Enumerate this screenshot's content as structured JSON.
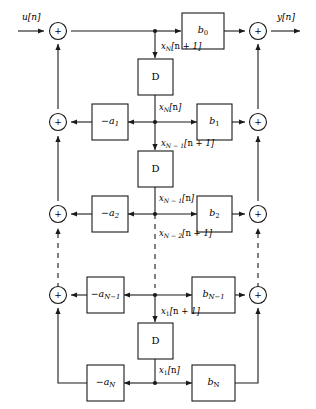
{
  "diagram": {
    "input_label": "u[n]",
    "output_label": "y[n]",
    "delay_label": "D",
    "sum_symbol": "+",
    "line_color": "#1a1a1a",
    "background_color": "#ffffff"
  },
  "delays": [
    {
      "name": "delay-1",
      "label": "D"
    },
    {
      "name": "delay-2",
      "label": "D"
    },
    {
      "name": "delay-3",
      "label": "D"
    },
    {
      "name": "delay-4",
      "label": "D"
    }
  ],
  "feedback_gains": [
    {
      "name": "gain-a1",
      "label_html": "−a<span class=\"sub\">1</span>",
      "text": "-a1"
    },
    {
      "name": "gain-a2",
      "label_html": "−a<span class=\"sub\">2</span>",
      "text": "-a2"
    },
    {
      "name": "gain-aN1",
      "label_html": "−a<span class=\"sub\">N−1</span>",
      "text": "-a(N-1)"
    },
    {
      "name": "gain-aN",
      "label_html": "−a<span class=\"sub\">N</span>",
      "text": "-aN"
    }
  ],
  "feedforward_gains": [
    {
      "name": "gain-b0",
      "label_html": "b<span class=\"sub-up\">0</span>",
      "text": "b0"
    },
    {
      "name": "gain-b1",
      "label_html": "b<span class=\"sub-up\">1</span>",
      "text": "b1"
    },
    {
      "name": "gain-b2",
      "label_html": "b<span class=\"sub-up\">2</span>",
      "text": "b2"
    },
    {
      "name": "gain-bN1",
      "label_html": "b<span class=\"sub\">N−1</span>",
      "text": "b(N-1)"
    },
    {
      "name": "gain-bN",
      "label_html": "b<span class=\"sub-up\">N</span>",
      "text": "bN"
    }
  ],
  "state_labels": [
    {
      "name": "state-xN-next",
      "html": "x<span class=\"sub\">N</span>[<span class=\"up\">n</span> + 1]",
      "text": "xN[n + 1]"
    },
    {
      "name": "state-xN",
      "html": "x<span class=\"sub\">N</span>[<span class=\"up\">n</span>]",
      "text": "xN[n]"
    },
    {
      "name": "state-xN1-next",
      "html": "x<span class=\"sub\">N − 1</span>[<span class=\"up\">n</span> + 1]",
      "text": "x(N-1)[n + 1]"
    },
    {
      "name": "state-xN1",
      "html": "x<span class=\"sub\">N − 1</span>[<span class=\"up\">n</span>]",
      "text": "x(N-1)[n]"
    },
    {
      "name": "state-xN2-next",
      "html": "x<span class=\"sub\">N − 2</span>[<span class=\"up\">n</span> + 1]",
      "text": "x(N-2)[n + 1]"
    },
    {
      "name": "state-x1-next",
      "html": "x<span class=\"sub-up\">1</span>[<span class=\"up\">n</span> + 1]",
      "text": "x1[n + 1]"
    },
    {
      "name": "state-x1",
      "html": "x<span class=\"sub-up\">1</span>[<span class=\"up\">n</span>]",
      "text": "x1[n]"
    }
  ],
  "summers": [
    {
      "name": "summer-input",
      "symbol": "+"
    },
    {
      "name": "summer-fb-1",
      "symbol": "+"
    },
    {
      "name": "summer-fb-2",
      "symbol": "+"
    },
    {
      "name": "summer-fb-N1",
      "symbol": "+"
    },
    {
      "name": "summer-out-0",
      "symbol": "+"
    },
    {
      "name": "summer-out-1",
      "symbol": "+"
    },
    {
      "name": "summer-out-2",
      "symbol": "+"
    },
    {
      "name": "summer-out-N1",
      "symbol": "+"
    }
  ]
}
